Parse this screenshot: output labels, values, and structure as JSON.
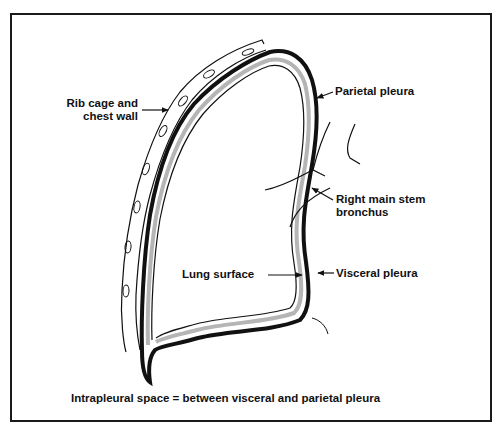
{
  "diagram": {
    "labels": {
      "rib_cage_line1": "Rib cage and",
      "rib_cage_line2": "chest wall",
      "parietal_pleura": "Parietal pleura",
      "bronchus_line1": "Right main stem",
      "bronchus_line2": "bronchus",
      "lung_surface": "Lung surface",
      "visceral_pleura": "Visceral pleura"
    },
    "caption": "Intrapleural space = between visceral and parietal pleura",
    "colors": {
      "outline": "#111111",
      "pleura_fill": "#b5b5b5",
      "background": "#ffffff",
      "frame": "#1a1a1a"
    }
  }
}
